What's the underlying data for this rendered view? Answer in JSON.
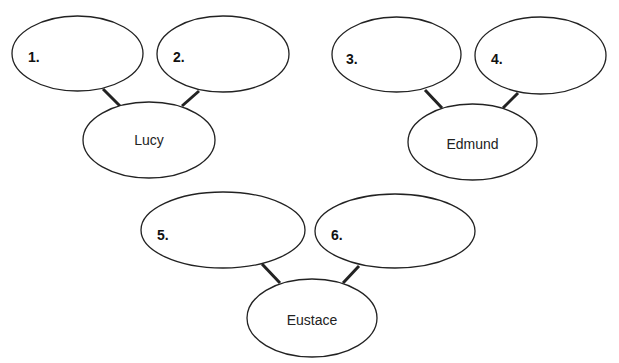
{
  "diagram": {
    "type": "family-tree-worksheet",
    "groups": [
      {
        "child": {
          "name": "Lucy"
        },
        "parents": [
          {
            "label": "1.",
            "value": ""
          },
          {
            "label": "2.",
            "value": ""
          }
        ]
      },
      {
        "child": {
          "name": "Edmund"
        },
        "parents": [
          {
            "label": "3.",
            "value": ""
          },
          {
            "label": "4.",
            "value": ""
          }
        ]
      },
      {
        "child": {
          "name": "Eustace"
        },
        "parents": [
          {
            "label": "5.",
            "value": ""
          },
          {
            "label": "6.",
            "value": ""
          }
        ]
      }
    ],
    "colors": {
      "stroke": "#222222",
      "background": "#ffffff"
    }
  }
}
